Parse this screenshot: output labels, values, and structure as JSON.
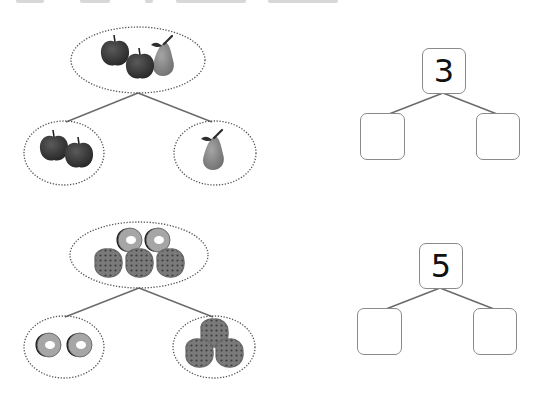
{
  "worksheet": {
    "problems": [
      {
        "id": "fruit",
        "whole_group": [
          "apple",
          "apple",
          "pear"
        ],
        "part_groups": [
          [
            "apple",
            "apple"
          ],
          [
            "pear"
          ]
        ],
        "number_bond": {
          "whole": "3",
          "parts": [
            "",
            ""
          ]
        }
      },
      {
        "id": "treats",
        "whole_group": [
          "donut",
          "donut",
          "waffle",
          "waffle",
          "waffle"
        ],
        "part_groups": [
          [
            "donut",
            "donut"
          ],
          [
            "waffle",
            "waffle",
            "waffle"
          ]
        ],
        "number_bond": {
          "whole": "5",
          "parts": [
            "",
            ""
          ]
        }
      }
    ]
  },
  "colors": {
    "apple": "#3a3a3a",
    "pear": "#8c8c8c",
    "donut": "#9a9a9a",
    "waffle": "#6f6f6f",
    "line": "#6a6a6a",
    "ellipse_border": "#555555",
    "box_border": "#8a8a8a"
  }
}
